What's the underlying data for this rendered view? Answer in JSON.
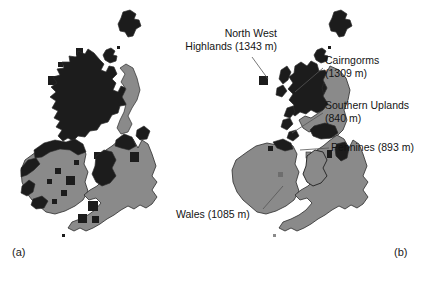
{
  "figure": {
    "kind": "two-panel-map-figure",
    "width": 422,
    "height": 281,
    "background_color": "#ffffff"
  },
  "colors": {
    "lowland_fill": "#8a8a8a",
    "upland_fill": "#1c1c1c",
    "outline": "#2b2b2b",
    "text": "#141414",
    "leader_line": "#555555"
  },
  "panels": [
    {
      "id": "a",
      "caption": "(a)",
      "legend_note": "",
      "annotations": []
    },
    {
      "id": "b",
      "caption": "(b)",
      "legend_note": "",
      "annotations": [
        {
          "key": "north_west_highlands",
          "text": "North West\nHighlands (1343 m)",
          "name": "North West Highlands",
          "elevation_m": 1343
        },
        {
          "key": "cairngorms",
          "text": "Cairngorms\n(1309 m)",
          "name": "Cairngorms",
          "elevation_m": 1309
        },
        {
          "key": "southern_uplands",
          "text": "Southern Uplands\n(840 m)",
          "name": "Southern Uplands",
          "elevation_m": 840
        },
        {
          "key": "pennines",
          "text": "Pennines (893 m)",
          "name": "Pennines",
          "elevation_m": 893
        },
        {
          "key": "wales",
          "text": "Wales (1085 m)",
          "name": "Wales",
          "elevation_m": 1085
        }
      ]
    }
  ]
}
